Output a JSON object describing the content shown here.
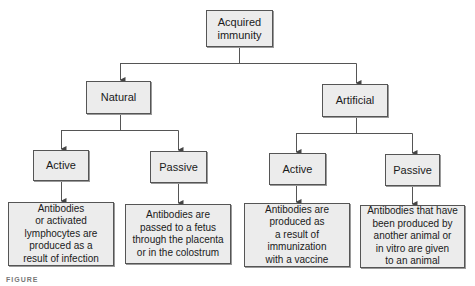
{
  "diagram": {
    "root": {
      "label_line1": "Acquired",
      "label_line2": "immunity"
    },
    "branches": [
      {
        "label": "Natural",
        "children": [
          {
            "label": "Active",
            "description": [
              "Antibodies",
              "or activated",
              "lymphocytes are",
              "produced as a",
              "result of infection"
            ]
          },
          {
            "label": "Passive",
            "description": [
              "Antibodies are",
              "passed to a fetus",
              "through the placenta",
              "or in the colostrum"
            ]
          }
        ]
      },
      {
        "label": "Artificial",
        "children": [
          {
            "label": "Active",
            "description": [
              "Antibodies are",
              "produced as",
              "a result of",
              "immunization",
              "with a vaccine"
            ]
          },
          {
            "label": "Passive",
            "description": [
              "Antibodies that have",
              "been produced by",
              "another animal or",
              "in vitro are given",
              "to an animal"
            ]
          }
        ]
      }
    ],
    "caption": "FIGURE"
  },
  "colors": {
    "box_fill": "#ececec",
    "box_border": "#555555",
    "line": "#555555"
  }
}
